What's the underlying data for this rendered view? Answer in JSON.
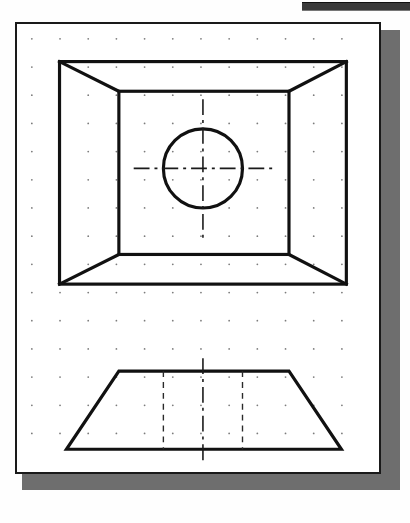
{
  "application": {
    "name": "cad-drawing-canvas",
    "title": "Orthographic Drawing Sheet",
    "toolbar_strip_label": "",
    "background_color": "#fefefe"
  },
  "sheet": {
    "label": "drawing-sheet",
    "paper_color": "#ffffff",
    "border_color": "#1a1a1a",
    "shadow_color": "#6e6e6e",
    "x": 15,
    "y": 22,
    "width": 366,
    "height": 452,
    "border_width": 2
  },
  "grid": {
    "label": "dot-grid",
    "visible": true,
    "spacing": 28.5,
    "origin_x": 30,
    "origin_y": 37,
    "dot_radius": 0.9,
    "dot_color": "#7c7c7c",
    "columns": 12,
    "rows": 15
  },
  "line_styles": {
    "object_color": "#111111",
    "object_width": 3.2,
    "hidden_color": "#2a2a2a",
    "hidden_width": 1.4,
    "hidden_dash": "6,5",
    "center_color": "#1a1a1a",
    "center_width": 1.6,
    "center_dash": "16,5,3,5"
  },
  "chart_data": {
    "type": "diagram",
    "views": [
      {
        "name": "top-view",
        "projection": "top",
        "description": "Square frustum seen from above: outer square, inner square, four corner taper lines, and a central circular hole.",
        "outer_rect": {
          "x1": 58,
          "y1": 60,
          "x2": 348,
          "y2": 285
        },
        "inner_rect": {
          "x1": 118,
          "y1": 90,
          "x2": 290,
          "y2": 255
        },
        "taper_lines": [
          {
            "x1": 58,
            "y1": 60,
            "x2": 118,
            "y2": 90
          },
          {
            "x1": 348,
            "y1": 60,
            "x2": 290,
            "y2": 90
          },
          {
            "x1": 58,
            "y1": 285,
            "x2": 118,
            "y2": 255
          },
          {
            "x1": 348,
            "y1": 285,
            "x2": 290,
            "y2": 255
          }
        ],
        "circle": {
          "cx": 203,
          "cy": 168,
          "r": 40
        },
        "centerlines": [
          {
            "orientation": "horizontal",
            "x1": 133,
            "y1": 168,
            "x2": 273,
            "y2": 168
          },
          {
            "orientation": "vertical",
            "x1": 203,
            "y1": 98,
            "x2": 203,
            "y2": 238
          }
        ]
      },
      {
        "name": "front-view",
        "projection": "front",
        "description": "Trapezoid elevation of the frustum with two hidden lines for the hole and a vertical centerline.",
        "trapezoid": [
          {
            "x": 118,
            "y": 373
          },
          {
            "x": 290,
            "y": 373
          },
          {
            "x": 343,
            "y": 452
          },
          {
            "x": 65,
            "y": 452
          }
        ],
        "hidden_lines": [
          {
            "x1": 163,
            "y1": 373,
            "x2": 163,
            "y2": 452
          },
          {
            "x1": 243,
            "y1": 373,
            "x2": 243,
            "y2": 452
          }
        ],
        "centerline": {
          "x1": 203,
          "y1": 360,
          "x2": 203,
          "y2": 467
        }
      }
    ],
    "annotations": [],
    "legend": [],
    "xlabel": "",
    "ylabel": ""
  }
}
